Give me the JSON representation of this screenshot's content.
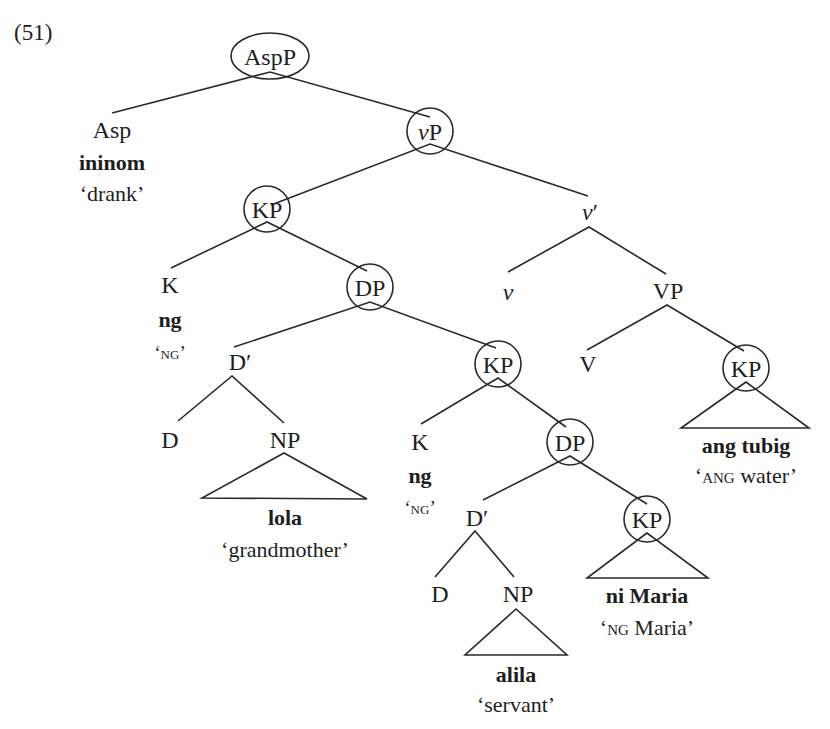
{
  "example_number": "(51)",
  "nodes": {
    "aspp": {
      "label": "AspP",
      "circled": true
    },
    "asp": {
      "label": "Asp",
      "word": "ininom",
      "gloss": "‘drank’"
    },
    "vp_little": {
      "label_italic": "v",
      "label": "P",
      "circled": true
    },
    "kp1": {
      "label": "KP",
      "circled": true
    },
    "vbar": {
      "label_italic": "v",
      "label": "′"
    },
    "k1": {
      "label": "K",
      "word": "ng",
      "gloss_open": "‘",
      "gloss_sc": "ng",
      "gloss_close": "’"
    },
    "dp1": {
      "label": "DP",
      "circled": true
    },
    "v_little": {
      "label_italic": "v"
    },
    "vp": {
      "label": "VP"
    },
    "dbar1": {
      "label": "D′"
    },
    "kp2": {
      "label": "KP",
      "circled": true
    },
    "v": {
      "label": "V"
    },
    "kp3": {
      "label": "KP",
      "circled": true,
      "word": "ang tubig",
      "gloss_open": "‘",
      "gloss_sc": "ang",
      "gloss_rest": " water’"
    },
    "d1": {
      "label": "D"
    },
    "np1": {
      "label": "NP",
      "word": "lola",
      "gloss": "‘grandmother’"
    },
    "k2": {
      "label": "K",
      "word": "ng",
      "gloss_open": "‘",
      "gloss_sc": "ng",
      "gloss_close": "’"
    },
    "dp2": {
      "label": "DP",
      "circled": true
    },
    "dbar2": {
      "label": "D′"
    },
    "kp4": {
      "label": "KP",
      "circled": true,
      "word": "ni Maria",
      "gloss_open": "‘",
      "gloss_sc": "ng",
      "gloss_rest": " Maria’"
    },
    "d2": {
      "label": "D"
    },
    "np2": {
      "label": "NP",
      "word": "alila",
      "gloss": "‘servant’"
    }
  },
  "colors": {
    "line": "#2a2a2a",
    "text": "#1e1e1e",
    "background": "#ffffff"
  }
}
